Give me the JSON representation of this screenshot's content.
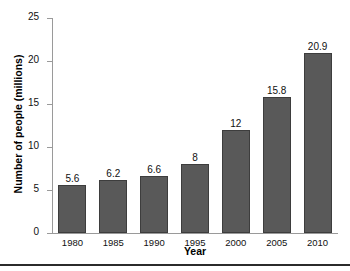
{
  "chart_data": {
    "type": "bar",
    "title": "",
    "subtitle": "",
    "xlabel": "Year",
    "ylabel": "Number of people (millions)",
    "categories": [
      "1980",
      "1985",
      "1990",
      "1995",
      "2000",
      "2005",
      "2010"
    ],
    "values": [
      5.6,
      6.2,
      6.6,
      8,
      12,
      15.8,
      20.9
    ],
    "value_labels": [
      "5.6",
      "6.2",
      "6.6",
      "8",
      "12",
      "15.8",
      "20.9"
    ],
    "ylim": [
      0,
      25
    ],
    "yticks": [
      0,
      5,
      10,
      15,
      20,
      25
    ],
    "ytick_labels": [
      "0",
      "5",
      "10",
      "15",
      "20",
      "25"
    ],
    "grid": false,
    "legend": false,
    "legend_position": "none",
    "bar_color": "#595959",
    "bar_edge_color": "#3d3d3d",
    "axis_color": "#9a9a9a",
    "text_color": "#111111",
    "background_color": "#ffffff"
  },
  "axes": {
    "y_title": "Number of people (millions)",
    "x_title": "Year"
  }
}
